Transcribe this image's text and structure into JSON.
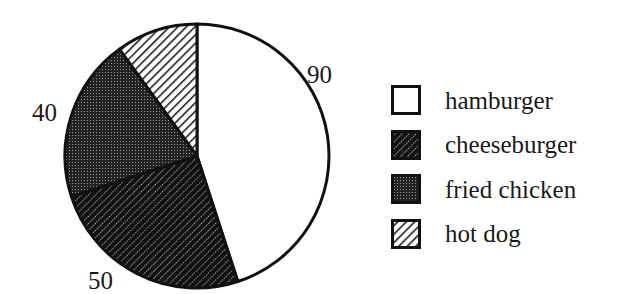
{
  "chart_data": {
    "type": "pie",
    "title": "",
    "start_angle_deg": 0,
    "direction": "clockwise",
    "slices": [
      {
        "name": "hamburger",
        "value": 90,
        "label": "90",
        "fill": "white"
      },
      {
        "name": "cheeseburger",
        "value": 50,
        "label": "50",
        "fill": "dense-diagonal-hatch"
      },
      {
        "name": "fried chicken",
        "value": 40,
        "label": "40",
        "fill": "dark-dotted"
      },
      {
        "name": "hot dog",
        "value": 20,
        "label": "",
        "fill": "light-diagonal-hatch"
      }
    ],
    "legend": {
      "position": "right",
      "entries": [
        "hamburger",
        "cheeseburger",
        "fried chicken",
        "hot dog"
      ]
    }
  },
  "labels": {
    "hamburger": "90",
    "cheeseburger": "50",
    "fried_chicken": "40"
  },
  "legend": {
    "items": [
      {
        "label": "hamburger"
      },
      {
        "label": "cheeseburger"
      },
      {
        "label": "fried chicken"
      },
      {
        "label": "hot dog"
      }
    ]
  }
}
